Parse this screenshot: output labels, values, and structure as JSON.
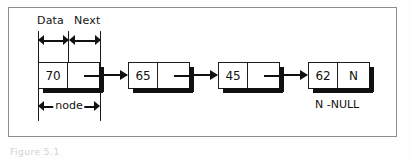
{
  "figure": {
    "title_labels": {
      "data": "Data",
      "next": "Next"
    },
    "node_dimension_label": "node",
    "null_legend": "N -NULL",
    "figure_caption": "Figure 5.1",
    "colors": {
      "ink": "#111111",
      "frame": "#8d8d8d",
      "background": "#ffffff",
      "shadow": "#111111"
    },
    "nodes": [
      {
        "data": "70",
        "next": "",
        "next_kind": "pointer-stub"
      },
      {
        "data": "65",
        "next": "",
        "next_kind": "pointer-stub"
      },
      {
        "data": "45",
        "next": "",
        "next_kind": "pointer-stub"
      },
      {
        "data": "62",
        "next": "N",
        "next_kind": "null-marker"
      }
    ],
    "links": [
      {
        "from": "70",
        "to": "65"
      },
      {
        "from": "65",
        "to": "45"
      },
      {
        "from": "45",
        "to": "62"
      }
    ]
  }
}
